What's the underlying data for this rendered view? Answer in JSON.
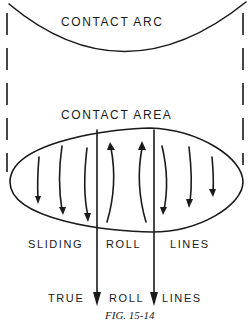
{
  "figure": {
    "caption": "FIG. 15-14",
    "labels": {
      "contact_arc": "CONTACT ARC",
      "contact_area": "CONTACT AREA",
      "sliding": "SLIDING",
      "roll": "ROLL",
      "lines": "LINES",
      "true": "TRUE",
      "roll2": "ROLL",
      "lines2": "LINES"
    },
    "elements": {
      "contact_arc_curve": "curve spanning top of figure",
      "dashed_boundaries": [
        "left",
        "right"
      ],
      "contact_area_ellipse": "lens-shaped contact patch",
      "sliding_arrows_outer_down": 6,
      "sliding_arrows_center_up": 2,
      "true_roll_lines": 2
    },
    "colors": {
      "ink": "#1a1a1a",
      "background": "#ffffff"
    }
  }
}
